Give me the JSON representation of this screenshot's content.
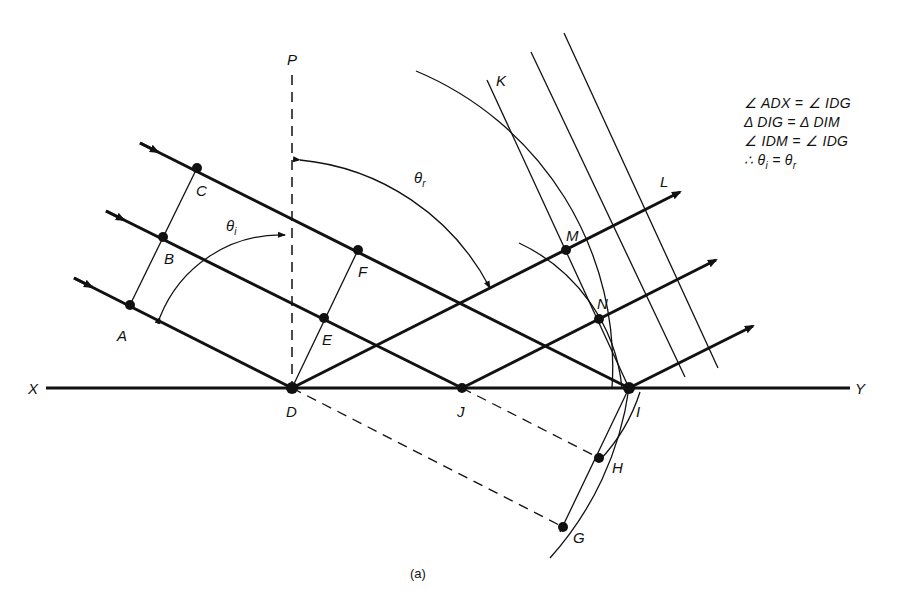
{
  "figure": {
    "caption": "(a)"
  },
  "labels": {
    "P": "P",
    "K": "K",
    "L": "L",
    "X": "X",
    "Y": "Y",
    "A": "A",
    "B": "B",
    "C": "C",
    "D": "D",
    "E": "E",
    "F": "F",
    "G": "G",
    "H": "H",
    "I": "I",
    "J": "J",
    "M": "M",
    "N": "N",
    "theta": "θ",
    "theta_i_sub": "i",
    "theta_r_sub": "r"
  },
  "equations": [
    {
      "lhs": "∠ ADX",
      "op": "=",
      "rhs": "∠ IDG"
    },
    {
      "lhs": "Δ DIG",
      "op": "=",
      "rhs": "Δ DIM"
    },
    {
      "lhs": "∠ IDM",
      "op": "=",
      "rhs": "∠ IDG"
    },
    {
      "lhs": "∴ θ",
      "lhs_sub": "i",
      "op": "=",
      "rhs": "θ",
      "rhs_sub": "r"
    }
  ],
  "points": {
    "A": [
      130,
      305
    ],
    "B": [
      163,
      237
    ],
    "C": [
      197,
      168
    ],
    "D": [
      292,
      388
    ],
    "E": [
      324,
      318
    ],
    "F": [
      358,
      250
    ],
    "J": [
      462,
      388
    ],
    "I": [
      629,
      388
    ],
    "M": [
      566,
      250
    ],
    "N": [
      599,
      319
    ],
    "H": [
      599,
      458
    ],
    "G": [
      563,
      527
    ]
  },
  "colors": {
    "ink": "#111111",
    "background": "#ffffff"
  }
}
